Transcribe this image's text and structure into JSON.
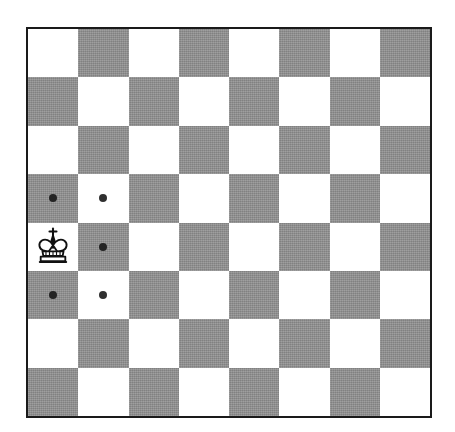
{
  "board": {
    "title": "Chess board diagram",
    "files": [
      "a",
      "b",
      "c",
      "d",
      "e",
      "f",
      "g",
      "h"
    ],
    "ranks": [
      "8",
      "7",
      "6",
      "5",
      "4",
      "3",
      "2",
      "1"
    ],
    "rows": 8,
    "columns": 8,
    "light_square_color": "#ffffff",
    "dark_square_color": "#8e8e8e",
    "border_color": "#1a1a1a",
    "marker_color": "#2b2b2b",
    "orientation": "white-bottom",
    "squares": [
      [
        "light",
        "dark",
        "light",
        "dark",
        "light",
        "dark",
        "light",
        "dark"
      ],
      [
        "dark",
        "light",
        "dark",
        "light",
        "dark",
        "light",
        "dark",
        "light"
      ],
      [
        "light",
        "dark",
        "light",
        "dark",
        "light",
        "dark",
        "light",
        "dark"
      ],
      [
        "dark",
        "light",
        "dark",
        "light",
        "dark",
        "light",
        "dark",
        "light"
      ],
      [
        "light",
        "dark",
        "light",
        "dark",
        "light",
        "dark",
        "light",
        "dark"
      ],
      [
        "dark",
        "light",
        "dark",
        "light",
        "dark",
        "light",
        "dark",
        "light"
      ],
      [
        "light",
        "dark",
        "light",
        "dark",
        "light",
        "dark",
        "light",
        "dark"
      ],
      [
        "dark",
        "light",
        "dark",
        "light",
        "dark",
        "light",
        "dark",
        "light"
      ]
    ]
  },
  "pieces": [
    {
      "type": "king",
      "color": "white",
      "glyph": "white-king-icon",
      "square": "a4",
      "row": 4,
      "col": 0,
      "label": "White King"
    }
  ],
  "move_markers": [
    {
      "square": "a5",
      "row": 3,
      "col": 0,
      "square_shade": "dark",
      "label": "legal move a5"
    },
    {
      "square": "b5",
      "row": 3,
      "col": 1,
      "square_shade": "light",
      "label": "legal move b5"
    },
    {
      "square": "b4",
      "row": 4,
      "col": 1,
      "square_shade": "dark",
      "label": "legal move b4"
    },
    {
      "square": "a3",
      "row": 5,
      "col": 0,
      "square_shade": "dark",
      "label": "legal move a3"
    },
    {
      "square": "b3",
      "row": 5,
      "col": 1,
      "square_shade": "light",
      "label": "legal move b3"
    }
  ],
  "chart_data": {
    "type": "table",
    "categories": [
      "a",
      "b",
      "c",
      "d",
      "e",
      "f",
      "g",
      "h"
    ],
    "ranks": [
      "8",
      "7",
      "6",
      "5",
      "4",
      "3",
      "2",
      "1"
    ],
    "piece_positions": [
      {
        "square": "a4",
        "piece": "white king"
      }
    ],
    "marked_squares": [
      "a5",
      "b5",
      "b4",
      "a3",
      "b3"
    ],
    "marked_count": 5
  }
}
